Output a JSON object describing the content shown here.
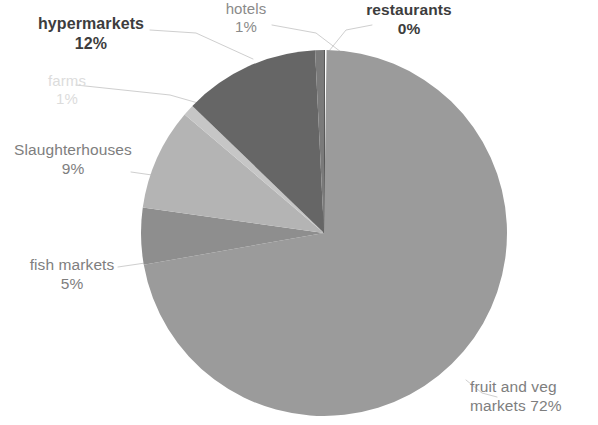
{
  "chart_data": {
    "type": "pie",
    "title": "",
    "subtitle": "",
    "xlabel": "",
    "ylabel": "",
    "legend_position": "none",
    "grid": false,
    "labels_show_percent": true,
    "total_percent": 100,
    "categories": [
      "restaurants",
      "fruit and veg markets",
      "fish markets",
      "Slaughterhouses",
      "farms",
      "hypermarkets",
      "hotels"
    ],
    "values": [
      0,
      72,
      5,
      9,
      1,
      12,
      1
    ],
    "slices": [
      {
        "name": "restaurants",
        "value": 0,
        "percent_label": "0%",
        "color": "#2f2f2f",
        "start_deg": 0,
        "end_deg": 0.8,
        "label_style": "bold-dark",
        "leader": true
      },
      {
        "name": "fruit and veg markets",
        "value": 72,
        "percent_label": "72%",
        "color": "#9b9b9b",
        "start_deg": 0.8,
        "end_deg": 260.0,
        "label_style": "mid-gray",
        "leader": true
      },
      {
        "name": "fish markets",
        "value": 5,
        "percent_label": "5%",
        "color": "#8e8e8e",
        "start_deg": 260.0,
        "end_deg": 278.0,
        "label_style": "mid-gray",
        "leader": true
      },
      {
        "name": "Slaughterhouses",
        "value": 9,
        "percent_label": "9%",
        "color": "#b4b4b4",
        "start_deg": 278.0,
        "end_deg": 310.4,
        "label_style": "mid-gray",
        "leader": true
      },
      {
        "name": "farms",
        "value": 1,
        "percent_label": "1%",
        "color": "#c6c6c6",
        "start_deg": 310.4,
        "end_deg": 314.0,
        "label_style": "very-faint",
        "leader": true
      },
      {
        "name": "hypermarkets",
        "value": 12,
        "percent_label": "12%",
        "color": "#666666",
        "start_deg": 314.0,
        "end_deg": 357.2,
        "label_style": "bold-dark",
        "leader": true
      },
      {
        "name": "hotels",
        "value": 1,
        "percent_label": "1%",
        "color": "#7a7a7a",
        "start_deg": 357.2,
        "end_deg": 360.0,
        "label_style": "mid-gray",
        "leader": true
      }
    ],
    "geometry": {
      "center_x": 324,
      "center_y": 233,
      "radius": 183,
      "start_angle_deg": 0,
      "direction": "clockwise"
    },
    "colors": {
      "background": "#ffffff",
      "leader_line": "#c9c9c9",
      "label_dark": "#3d3d3d",
      "label_gray": "#8a8a8a",
      "label_faint": "#dcdcdc"
    }
  },
  "labels": {
    "restaurants": {
      "name": "restaurants",
      "percent": "0%"
    },
    "hotels": {
      "name": "hotels",
      "percent": "1%"
    },
    "hypermarkets": {
      "name": "hypermarkets",
      "percent": "12%"
    },
    "farms": {
      "name": "farms",
      "percent": "1%"
    },
    "slaughterhouses": {
      "name": "Slaughterhouses",
      "percent": "9%"
    },
    "fish_markets": {
      "name": "fish markets",
      "percent": "5%"
    },
    "fruit_veg": {
      "name": "fruit and veg",
      "percent": "markets 72%"
    }
  }
}
